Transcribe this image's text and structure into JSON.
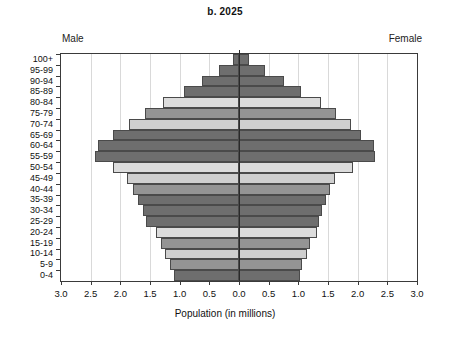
{
  "title": "b. 2025",
  "labels": {
    "male_side": "Male",
    "female_side": "Female",
    "x_axis_title": "Population (in millions)"
  },
  "axis": {
    "x_ticks": [
      "3.0",
      "2.5",
      "2.0",
      "1.5",
      "1.0",
      "0.5",
      "0.0",
      "0.5",
      "1.0",
      "1.5",
      "2.0",
      "2.5",
      "3.0"
    ],
    "x_tick_values": [
      -3.0,
      -2.5,
      -2.0,
      -1.5,
      -1.0,
      -0.5,
      0.0,
      0.5,
      1.0,
      1.5,
      2.0,
      2.5,
      3.0
    ],
    "x_min": -3.0,
    "x_max": 3.0
  },
  "colors": {
    "dark_gray": "#6e6e6e",
    "mid_gray": "#949494",
    "light_gray": "#cfcfcf",
    "very_light_gray": "#dcdcdc",
    "bar_outline": "#4a4a4a",
    "gridline": "#d9d9d9",
    "centerline": "#2a2a2a",
    "frame": "#3a3a3a"
  },
  "chart_data": {
    "type": "bar",
    "subtype": "population-pyramid",
    "title": "b. 2025",
    "xlabel": "Population (in millions)",
    "ylabel": "",
    "xlim": [
      -3.0,
      3.0
    ],
    "grid": true,
    "legend": false,
    "categories": [
      "0-4",
      "5-9",
      "10-14",
      "15-19",
      "20-24",
      "25-29",
      "30-34",
      "35-39",
      "40-44",
      "45-49",
      "50-54",
      "55-59",
      "60-64",
      "65-69",
      "70-74",
      "75-79",
      "80-84",
      "85-89",
      "90-94",
      "95-99",
      "100+"
    ],
    "series": [
      {
        "name": "Male",
        "direction": "left",
        "values": [
          1.1,
          1.16,
          1.25,
          1.32,
          1.4,
          1.56,
          1.62,
          1.7,
          1.78,
          1.88,
          2.12,
          2.43,
          2.38,
          2.12,
          1.86,
          1.58,
          1.28,
          0.92,
          0.62,
          0.34,
          0.1
        ]
      },
      {
        "name": "Female",
        "direction": "right",
        "values": [
          1.02,
          1.07,
          1.14,
          1.2,
          1.32,
          1.35,
          1.4,
          1.46,
          1.54,
          1.62,
          1.92,
          2.29,
          2.28,
          2.06,
          1.88,
          1.63,
          1.38,
          1.04,
          0.76,
          0.44,
          0.17
        ]
      }
    ],
    "bar_shades": [
      "dark_gray",
      "mid_gray",
      "light_gray",
      "mid_gray",
      "very_light_gray",
      "dark_gray",
      "dark_gray",
      "dark_gray",
      "mid_gray",
      "light_gray",
      "very_light_gray",
      "dark_gray",
      "dark_gray",
      "dark_gray",
      "light_gray",
      "mid_gray",
      "very_light_gray",
      "dark_gray",
      "dark_gray",
      "dark_gray",
      "dark_gray"
    ]
  }
}
